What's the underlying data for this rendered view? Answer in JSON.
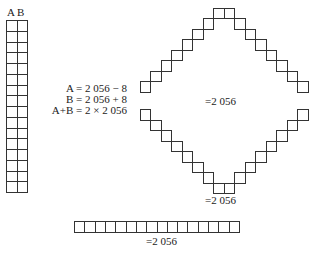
{
  "column": {
    "header_a": "A",
    "header_b": "B",
    "rows": 16,
    "cols": 2
  },
  "equations": [
    "A = 2 056 − 8",
    "B = 2 056 + 8",
    "A+B = 2 × 2 056"
  ],
  "diamond": {
    "center_label": "=2 056",
    "bottom_label": "=2 056",
    "diagonal_steps": 7
  },
  "bar": {
    "cells": 16,
    "label": "=2 056"
  },
  "colors": {
    "stroke": "#333333",
    "background": "#ffffff"
  }
}
